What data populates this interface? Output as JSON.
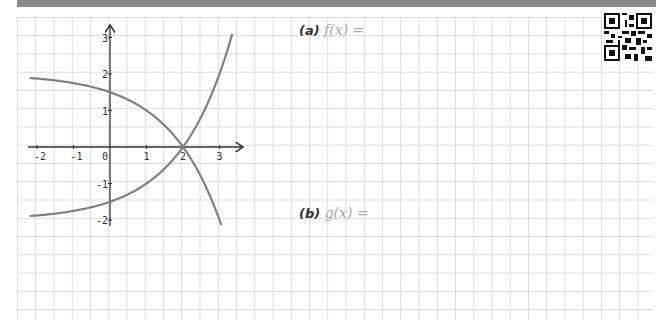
{
  "worksheet": {
    "questions": [
      {
        "part": "(a)",
        "expr": "f(x) ="
      },
      {
        "part": "(b)",
        "expr": "g(x) ="
      }
    ]
  },
  "chart_data": {
    "type": "line",
    "title": "",
    "xlabel": "",
    "ylabel": "",
    "x_ticks": [
      "-2",
      "-1",
      "0",
      "1",
      "2",
      "3"
    ],
    "y_ticks": [
      "3",
      "2",
      "1",
      "-1",
      "-2"
    ],
    "xlim": [
      -2.25,
      3.5
    ],
    "ylim": [
      -2.1,
      3.3
    ],
    "grid": true,
    "series": [
      {
        "name": "f",
        "description": "decreasing curve, f(x) = 2 - 2^(x-1)",
        "points": [
          [
            -2.2,
            1.89
          ],
          [
            -1,
            1.75
          ],
          [
            0,
            1.5
          ],
          [
            1,
            1.0
          ],
          [
            2,
            0
          ],
          [
            3,
            -2.0
          ],
          [
            3.05,
            -2.14
          ]
        ]
      },
      {
        "name": "g",
        "description": "increasing curve, g(x) = 2^(x-1) - 2",
        "points": [
          [
            -2.2,
            -1.89
          ],
          [
            -1,
            -1.75
          ],
          [
            0,
            -1.5
          ],
          [
            1,
            -1.0
          ],
          [
            2,
            0
          ],
          [
            3,
            2.0
          ],
          [
            3.35,
            3.1
          ]
        ]
      }
    ],
    "intersection": [
      2,
      0
    ]
  },
  "colors": {
    "curve": "#808080",
    "axis": "#333333",
    "grid": "#dcdcdc",
    "topbar": "#8a8a8a"
  }
}
